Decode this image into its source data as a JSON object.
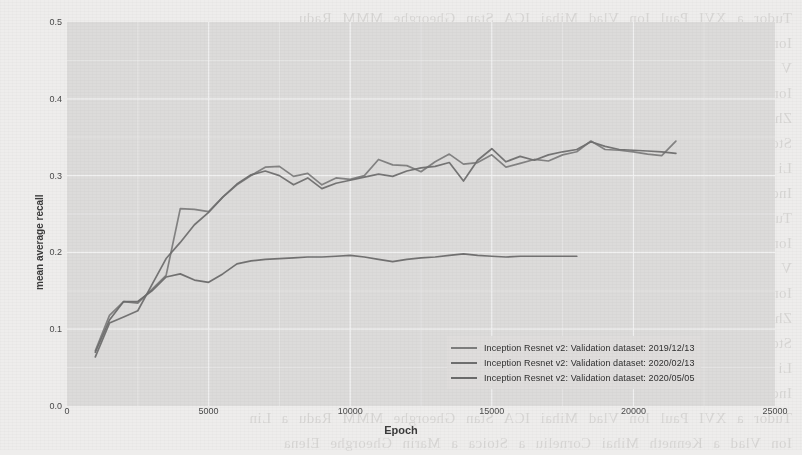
{
  "chart_data": {
    "type": "line",
    "title": "",
    "xlabel": "Epoch",
    "ylabel": "mean average recall",
    "xlim": [
      0,
      25000
    ],
    "ylim": [
      0.0,
      0.5
    ],
    "xticks": [
      "0",
      "5000",
      "10000",
      "15000",
      "20000",
      "25000"
    ],
    "xtick_values": [
      0,
      5000,
      10000,
      15000,
      20000,
      25000
    ],
    "yticks": [
      "0.0",
      "0.1",
      "0.2",
      "0.3",
      "0.4",
      "0.5"
    ],
    "ytick_values": [
      0.0,
      0.1,
      0.2,
      0.3,
      0.4,
      0.5
    ],
    "grid": true,
    "legend_position": "bottom-right",
    "panel_background": "#dcdbda",
    "gridline_color": "#f4f4f4",
    "series": [
      {
        "name": "Inception Resnet v2: Validation dataset: 2019/12/13",
        "color": "#7d7d7d",
        "x": [
          1000,
          1500,
          2000,
          2500,
          3000,
          3500,
          4000,
          4500,
          5000,
          5500,
          6000,
          6500,
          7000,
          7500,
          8000,
          8500,
          9000,
          9500,
          10000,
          10500,
          11000,
          11500,
          12000,
          12500,
          13000,
          13500,
          14000,
          14500,
          15000,
          15500,
          16000,
          16500,
          17000,
          17500,
          18000,
          18500,
          19000,
          19500,
          20000,
          20500,
          21000,
          21500
        ],
        "y": [
          0.072,
          0.118,
          0.136,
          0.134,
          0.152,
          0.17,
          0.257,
          0.256,
          0.253,
          0.272,
          0.288,
          0.3,
          0.311,
          0.312,
          0.299,
          0.303,
          0.288,
          0.297,
          0.295,
          0.3,
          0.321,
          0.314,
          0.313,
          0.305,
          0.318,
          0.328,
          0.315,
          0.317,
          0.327,
          0.311,
          0.316,
          0.321,
          0.319,
          0.327,
          0.331,
          0.345,
          0.334,
          0.333,
          0.331,
          0.328,
          0.326,
          0.345
        ]
      },
      {
        "name": "Inception Resnet v2: Validation dataset: 2020/02/13",
        "color": "#6f6f6f",
        "x": [
          1000,
          1500,
          2000,
          2500,
          3000,
          3500,
          4000,
          4500,
          5000,
          5500,
          6000,
          6500,
          7000,
          7500,
          8000,
          8500,
          9000,
          9500,
          10000,
          10500,
          11000,
          11500,
          12000,
          12500,
          13000,
          13500,
          14000,
          14500,
          15000,
          15500,
          16000,
          16500,
          17000,
          17500,
          18000,
          18500,
          19000,
          19500,
          20000,
          20500,
          21000,
          21500
        ],
        "y": [
          0.064,
          0.108,
          0.116,
          0.124,
          0.158,
          0.192,
          0.213,
          0.236,
          0.252,
          0.272,
          0.289,
          0.301,
          0.306,
          0.3,
          0.288,
          0.297,
          0.283,
          0.29,
          0.294,
          0.298,
          0.302,
          0.299,
          0.306,
          0.31,
          0.312,
          0.317,
          0.293,
          0.32,
          0.335,
          0.318,
          0.325,
          0.32,
          0.327,
          0.331,
          0.334,
          0.344,
          0.338,
          0.334,
          0.333,
          0.332,
          0.331,
          0.329
        ]
      },
      {
        "name": "Inception Resnet v2: Validation dataset: 2020/05/05",
        "color": "#6b6b6b",
        "x": [
          1000,
          1500,
          2000,
          2500,
          3000,
          3500,
          4000,
          4500,
          5000,
          5500,
          6000,
          6500,
          7000,
          7500,
          8000,
          8500,
          9000,
          9500,
          10000,
          10500,
          11000,
          11500,
          12000,
          12500,
          13000,
          13500,
          14000,
          14500,
          15000,
          15500,
          16000,
          16500,
          17000,
          17500,
          18000
        ],
        "y": [
          0.07,
          0.112,
          0.136,
          0.136,
          0.15,
          0.168,
          0.172,
          0.164,
          0.161,
          0.172,
          0.185,
          0.189,
          0.191,
          0.192,
          0.193,
          0.194,
          0.194,
          0.195,
          0.196,
          0.194,
          0.191,
          0.188,
          0.191,
          0.193,
          0.194,
          0.196,
          0.198,
          0.196,
          0.195,
          0.194,
          0.195,
          0.195,
          0.195,
          0.195,
          0.195
        ]
      }
    ]
  },
  "legend": {
    "items": [
      {
        "label": "Inception Resnet v2: Validation dataset: 2019/12/13",
        "color": "#7d7d7d"
      },
      {
        "label": "Inception Resnet v2: Validation dataset: 2020/02/13",
        "color": "#6f6f6f"
      },
      {
        "label": "Inception Resnet v2: Validation dataset: 2020/05/05",
        "color": "#6b6b6b"
      }
    ]
  },
  "background_text": {
    "lines": [
      "Tudor  a  XVI  Paul  Ion  Vlad  Mihai  ICA  Stan  Gheorghe  MMM  Radu",
      "Ion  Vlad  a  Kenneth  Mihai  Corneliu  a  Stoica  a  Marin  Gheorghe  Elena",
      "V  Chen  Lin  a  GHz  a  Ion  Ma  la  Pan  a  Vo  Li  a  Guo  a  CS  a  Vlad",
      "Ion  Brown  a  CNN  Wu  Yang  Li  Ma  Tang  a  GPU  Lee  Kim  a  Park  a",
      "Zhang  Liu  a  Wang  a  Chen  a  Huang  a  Zhao  a  Sun  a  Wu  a  Xu  a  He",
      "Stoica  a  Popescu  a  Ionescu  a  Dumitru  a  Andrei  a  Cristian  a  Mircea",
      "Li  a  Deng  a  Socher  a  ImageNet  a  CVPR  a  Szegedy  a  Ioffe  a  Vanhoucke",
      "Inception  a  ResNet  a  Google  a  TensorFlow  a  COCO  a  mAP  a  recall",
      "Tudor  a  XVI  Paul  Ion  Vlad  Mihai  ICA  Stan  Gheorghe  MMM  Radu  a  Lin",
      "Ion  Vlad  a  Kenneth  Mihai  Corneliu  a  Stoica  a  Marin  Gheorghe  Elena",
      "V  Chen  Lin  a  GHz  a  Ion  Ma  la  Pan  a  Vo  Li  a  Guo  a  CS  a  Vlad  a",
      "Ion  Brown  a  CNN  Wu  Yang  Li  Ma  Tang  a  GPU  Lee  Kim  a  Park  a  Jin",
      "Zhang  Liu  a  Wang  a  Chen  a  Huang  a  Zhao  a  Sun  a  Wu  a  Xu  a  He",
      "Stoica  a  Popescu  a  Ionescu  a  Dumitru  a  Andrei  a  Cristian  a  Mircea",
      "Li  a  Deng  a  Socher  a  ImageNet  a  CVPR  a  Szegedy  a  Ioffe  a  Vanhoucke",
      "Inception  a  ResNet  a  Google  a  TensorFlow  a  COCO  a  mAP  a  recall  a",
      "Tudor  a  XVI  Paul  Ion  Vlad  Mihai  ICA  Stan  Gheorghe  MMM  Radu  a  Lin",
      "Ion  Vlad  a  Kenneth  Mihai  Corneliu  a  Stoica  a  Marin  Gheorghe  Elena"
    ]
  }
}
